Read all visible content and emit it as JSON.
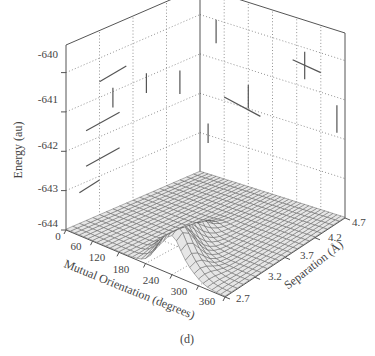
{
  "chart_data": {
    "type": "surface3d",
    "panel_label": "(d)",
    "title": "",
    "zlabel": "Energy (au)",
    "xlabel": "Mutual Orientation (degrees)",
    "ylabel": "Separation (Å)",
    "z_ticks": [
      "-640",
      "-641",
      "-642",
      "-643",
      "-644"
    ],
    "x_ticks": [
      "0",
      "60",
      "120",
      "180",
      "240",
      "300",
      "360"
    ],
    "y_ticks": [
      "2.7",
      "3.2",
      "3.7",
      "4.2",
      "4.7"
    ],
    "zlim": [
      -644,
      -639.3
    ],
    "xlim": [
      0,
      360
    ],
    "ylim": [
      2.7,
      4.7
    ],
    "grid": true,
    "grid_style": "dotted",
    "surface": {
      "description": "Mostly flat energy surface near -644 au, with a sharp ridge of peaks around orientation 180–240 degrees at small separation (2.7–3.2 Å), rising to roughly -643.2 au",
      "baseline": -644,
      "peaks": [
        {
          "orientation": 180,
          "separation": 3.3,
          "energy": -643.2
        },
        {
          "orientation": 210,
          "separation": 3.0,
          "energy": -643.1
        },
        {
          "orientation": 240,
          "separation": 2.8,
          "energy": -643.3
        }
      ]
    }
  }
}
